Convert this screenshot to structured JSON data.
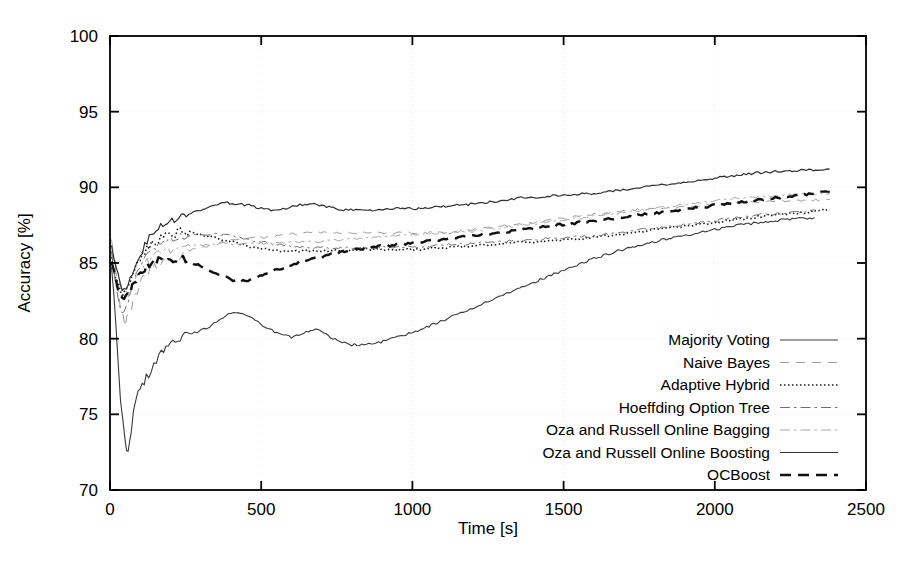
{
  "chart_data": {
    "type": "line",
    "title": "",
    "xlabel": "Time [s]",
    "ylabel": "Accuracy [%]",
    "xlim": [
      0,
      2500
    ],
    "ylim": [
      70,
      100
    ],
    "xticks": [
      0,
      500,
      1000,
      1500,
      2000,
      2500
    ],
    "yticks": [
      70,
      75,
      80,
      85,
      90,
      95,
      100
    ],
    "grid": true,
    "legend_position": "inside-lower-right",
    "series": [
      {
        "name": "Majority Voting",
        "style": "solid",
        "width": 1.1,
        "color": "#3a3a3a",
        "x": [
          5,
          20,
          35,
          50,
          60,
          70,
          85,
          100,
          120,
          145,
          170,
          200,
          240,
          280,
          320,
          360,
          400,
          440,
          480,
          520,
          560,
          600,
          640,
          680,
          700,
          730,
          760,
          800,
          840,
          880,
          920,
          980,
          1040,
          1100,
          1160,
          1220,
          1280,
          1340,
          1400,
          1460,
          1520,
          1600,
          1680,
          1760,
          1840,
          1920,
          2000,
          2080,
          2160,
          2240,
          2330
        ],
        "y": [
          85.0,
          80.5,
          76.0,
          73.2,
          72.5,
          74.0,
          76.0,
          76.8,
          77.4,
          78.2,
          79.0,
          79.6,
          80.1,
          80.4,
          80.7,
          81.2,
          81.7,
          81.6,
          81.2,
          80.7,
          80.3,
          80.1,
          80.4,
          80.6,
          80.5,
          80.1,
          79.8,
          79.6,
          79.6,
          79.7,
          79.9,
          80.3,
          80.7,
          81.2,
          81.7,
          82.2,
          82.7,
          83.2,
          83.7,
          84.2,
          84.7,
          85.3,
          85.8,
          86.2,
          86.6,
          86.9,
          87.2,
          87.5,
          87.7,
          87.9,
          88.0
        ]
      },
      {
        "name": "Naive Bayes",
        "style": "dashed-light",
        "width": 1.0,
        "color": "#9a9a9a",
        "x": [
          5,
          20,
          35,
          50,
          70,
          90,
          110,
          140,
          170,
          200,
          240,
          280,
          320,
          360,
          400,
          440,
          480,
          520,
          560,
          600,
          660,
          720,
          780,
          840,
          900,
          960,
          1020,
          1080,
          1160,
          1240,
          1320,
          1400,
          1480,
          1560,
          1640,
          1720,
          1800,
          1880,
          1960,
          2040,
          2120,
          2200,
          2280,
          2380
        ],
        "y": [
          86.0,
          84.5,
          82.0,
          81.0,
          82.0,
          83.2,
          84.0,
          84.6,
          85.0,
          85.3,
          85.6,
          85.9,
          86.1,
          86.3,
          86.5,
          86.6,
          86.7,
          86.7,
          86.8,
          86.9,
          87.0,
          87.0,
          87.0,
          87.0,
          87.0,
          87.0,
          87.0,
          87.0,
          87.1,
          87.3,
          87.5,
          87.7,
          87.9,
          88.1,
          88.3,
          88.5,
          88.6,
          88.7,
          88.8,
          88.9,
          89.0,
          89.1,
          89.1,
          89.2
        ]
      },
      {
        "name": "Adaptive Hybrid",
        "style": "dotted",
        "width": 1.6,
        "color": "#1e1e1e",
        "x": [
          5,
          20,
          40,
          60,
          80,
          100,
          130,
          160,
          200,
          240,
          280,
          320,
          360,
          400,
          440,
          480,
          520,
          560,
          600,
          640,
          680,
          720,
          780,
          840,
          900,
          960,
          1020,
          1080,
          1160,
          1240,
          1320,
          1400,
          1480,
          1560,
          1640,
          1720,
          1800,
          1880,
          1960,
          2040,
          2120,
          2200,
          2280,
          2380
        ],
        "y": [
          85.5,
          84.0,
          83.0,
          83.6,
          84.6,
          85.4,
          86.1,
          86.6,
          86.9,
          87.1,
          87.0,
          86.8,
          86.6,
          86.4,
          86.2,
          86.0,
          85.9,
          85.8,
          85.8,
          85.8,
          85.8,
          85.8,
          85.8,
          85.9,
          85.9,
          85.9,
          85.9,
          86.0,
          86.1,
          86.2,
          86.3,
          86.4,
          86.5,
          86.6,
          86.8,
          87.0,
          87.2,
          87.4,
          87.6,
          87.8,
          88.0,
          88.2,
          88.3,
          88.5
        ]
      },
      {
        "name": "Hoeffding Option Tree",
        "style": "dashdot",
        "width": 1.0,
        "color": "#707070",
        "x": [
          5,
          20,
          40,
          60,
          80,
          100,
          130,
          160,
          200,
          250,
          300,
          350,
          400,
          450,
          500,
          560,
          620,
          680,
          740,
          800,
          880,
          960,
          1040,
          1120,
          1200,
          1280,
          1360,
          1440,
          1520,
          1600,
          1680,
          1760,
          1840,
          1920,
          2000,
          2080,
          2160,
          2240,
          2330
        ],
        "y": [
          85.8,
          83.5,
          81.5,
          82.5,
          83.8,
          84.8,
          85.6,
          86.1,
          86.5,
          86.8,
          86.9,
          86.9,
          86.8,
          86.6,
          86.4,
          86.2,
          86.1,
          86.0,
          86.0,
          86.0,
          86.0,
          86.1,
          86.1,
          86.2,
          86.3,
          86.4,
          86.5,
          86.6,
          86.7,
          86.8,
          87.0,
          87.2,
          87.4,
          87.6,
          87.8,
          88.0,
          88.2,
          88.3,
          88.5
        ]
      },
      {
        "name": "Oza and Russell Online Bagging",
        "style": "dashdot-light",
        "width": 1.0,
        "color": "#a8a8a8",
        "x": [
          5,
          20,
          40,
          60,
          80,
          100,
          130,
          160,
          200,
          250,
          300,
          350,
          400,
          450,
          500,
          560,
          620,
          680,
          740,
          800,
          880,
          960,
          1040,
          1120,
          1200,
          1280,
          1360,
          1440,
          1520,
          1600,
          1680,
          1760,
          1840,
          1920,
          2000,
          2080,
          2160,
          2240,
          2380
        ],
        "y": [
          86.5,
          85.0,
          83.5,
          83.0,
          83.8,
          84.6,
          85.2,
          85.6,
          85.9,
          86.1,
          86.2,
          86.3,
          86.3,
          86.3,
          86.3,
          86.3,
          86.4,
          86.4,
          86.5,
          86.6,
          86.7,
          86.8,
          86.9,
          87.0,
          87.1,
          87.3,
          87.5,
          87.7,
          87.9,
          88.1,
          88.3,
          88.5,
          88.7,
          88.9,
          89.1,
          89.3,
          89.4,
          89.5,
          89.6
        ]
      },
      {
        "name": "Oza and Russell Online Boosting",
        "style": "solid",
        "width": 1.2,
        "color": "#303030",
        "x": [
          5,
          20,
          40,
          60,
          80,
          100,
          130,
          160,
          190,
          220,
          260,
          300,
          340,
          380,
          420,
          460,
          500,
          540,
          580,
          620,
          660,
          700,
          740,
          780,
          820,
          860,
          900,
          960,
          1020,
          1080,
          1140,
          1200,
          1280,
          1360,
          1440,
          1520,
          1600,
          1680,
          1760,
          1840,
          1920,
          2000,
          2080,
          2160,
          2240,
          2380
        ],
        "y": [
          86.2,
          84.8,
          83.4,
          83.6,
          84.6,
          85.6,
          86.6,
          87.3,
          87.7,
          87.9,
          88.2,
          88.5,
          88.8,
          89.0,
          88.9,
          88.8,
          88.6,
          88.5,
          88.6,
          88.8,
          88.9,
          88.8,
          88.6,
          88.5,
          88.5,
          88.5,
          88.5,
          88.6,
          88.6,
          88.7,
          88.8,
          88.9,
          89.1,
          89.3,
          89.4,
          89.5,
          89.6,
          89.8,
          90.0,
          90.2,
          90.4,
          90.6,
          90.8,
          91.0,
          91.1,
          91.2
        ]
      },
      {
        "name": "OCBoost",
        "style": "thick-dashed",
        "width": 2.4,
        "color": "#101010",
        "x": [
          5,
          20,
          40,
          60,
          80,
          100,
          130,
          160,
          200,
          250,
          300,
          350,
          400,
          440,
          480,
          520,
          560,
          600,
          650,
          700,
          760,
          820,
          880,
          940,
          1000,
          1080,
          1160,
          1240,
          1320,
          1400,
          1480,
          1560,
          1640,
          1720,
          1800,
          1880,
          1960,
          2040,
          2120,
          2200,
          2280,
          2380
        ],
        "y": [
          85.2,
          83.8,
          82.6,
          82.8,
          83.6,
          84.3,
          84.9,
          85.2,
          85.3,
          85.2,
          84.8,
          84.3,
          83.9,
          83.8,
          84.0,
          84.3,
          84.6,
          84.9,
          85.2,
          85.4,
          85.7,
          85.9,
          86.1,
          86.2,
          86.3,
          86.5,
          86.7,
          86.9,
          87.1,
          87.3,
          87.5,
          87.7,
          87.9,
          88.1,
          88.3,
          88.5,
          88.7,
          88.9,
          89.1,
          89.3,
          89.5,
          89.7
        ]
      }
    ]
  },
  "axes": {
    "x_label": "Time [s]",
    "y_label": "Accuracy [%]",
    "x_ticks": [
      "0",
      "500",
      "1000",
      "1500",
      "2000",
      "2500"
    ],
    "y_ticks": [
      "70",
      "75",
      "80",
      "85",
      "90",
      "95",
      "100"
    ]
  },
  "legend": {
    "entries": [
      {
        "label": "Majority Voting"
      },
      {
        "label": "Naive Bayes"
      },
      {
        "label": "Adaptive Hybrid"
      },
      {
        "label": "Hoeffding Option Tree"
      },
      {
        "label": "Oza and Russell Online Bagging"
      },
      {
        "label": "Oza and Russell Online Boosting"
      },
      {
        "label": "OCBoost"
      }
    ]
  },
  "colors": {
    "axis": "#000000",
    "grid": "#e8e8e8",
    "background": "#ffffff"
  }
}
